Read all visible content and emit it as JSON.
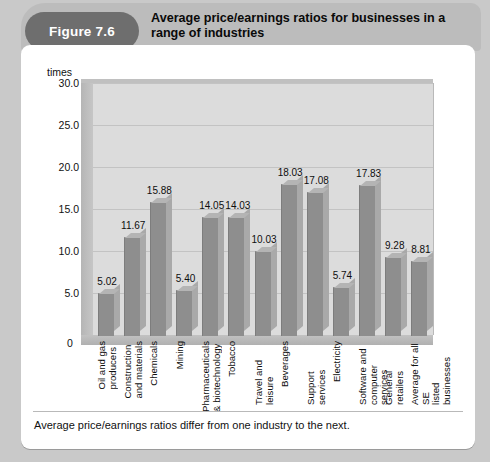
{
  "header": {
    "badge": "Figure 7.6",
    "title": "Average price/earnings ratios for businesses in a range of industries"
  },
  "caption": "Average price/earnings ratios differ from one industry to the next.",
  "colors": {
    "badge_bg": "#6e6e6e",
    "header_band": "#bcbcbc",
    "panel_bg": "#ffffff",
    "plot_bg": "#dcdcdc",
    "bar_front": "#8e8e8e",
    "bar_side": "#a9a9a9",
    "gridline": "#c3c3c3",
    "page_bg": "#c9c9c9"
  },
  "chart_data": {
    "type": "bar",
    "title": "Average price/earnings ratios for businesses in a range of industries",
    "xlabel": "",
    "ylabel": "times",
    "ylim": [
      0,
      30
    ],
    "yticks": [
      "30.0",
      "25.0",
      "20.0",
      "15.0",
      "10.0",
      "5.0"
    ],
    "ytick_values": [
      30,
      25,
      20,
      15,
      10,
      5
    ],
    "origin_label": "0",
    "grid": true,
    "legend": "none",
    "categories": [
      "Oil and gas\nproducers",
      "Construction\nand materials",
      "Chemicals",
      "Mining",
      "Pharmaceuticals\n& biotechnology",
      "Tobacco",
      "Travel and leisure",
      "Beverages",
      "Support services",
      "Electricity",
      "Software and\ncomputer services",
      "General retailers",
      "Average for all SE\nlisted businesses"
    ],
    "values": [
      5.02,
      11.67,
      15.88,
      5.4,
      14.05,
      14.03,
      10.03,
      18.03,
      17.08,
      5.74,
      17.83,
      9.28,
      8.81
    ],
    "value_labels": [
      "5.02",
      "11.67",
      "15.88",
      "5.40",
      "14.05",
      "14.03",
      "10.03",
      "18.03",
      "17.08",
      "5.74",
      "17.83",
      "9.28",
      "8.81"
    ]
  }
}
